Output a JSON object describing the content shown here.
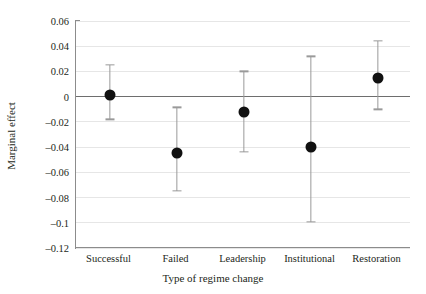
{
  "chart_data": {
    "type": "scatter",
    "title": "",
    "xlabel": "Type of regime change",
    "ylabel": "Marginal effect",
    "categories": [
      "Successful",
      "Failed",
      "Leadership",
      "Institutional",
      "Restoration"
    ],
    "values": [
      0.0015,
      -0.0445,
      -0.0125,
      -0.04,
      0.015
    ],
    "error_low": [
      -0.018,
      -0.0745,
      -0.044,
      -0.099,
      -0.01
    ],
    "error_high": [
      0.025,
      -0.0085,
      0.02,
      0.032,
      0.044
    ],
    "ylim": [
      -0.12,
      0.06
    ],
    "yticks": [
      0.06,
      0.04,
      0.02,
      0,
      -0.02,
      -0.04,
      -0.06,
      -0.08,
      -0.1,
      -0.12
    ],
    "ytick_labels": [
      "0.06",
      "0.04",
      "0.02",
      "0",
      "–0.02",
      "–0.04",
      "–0.06",
      "–0.08",
      "–0.1",
      "–0.12"
    ],
    "grid": true,
    "legend": "none",
    "reference_line": 0,
    "marker_color": "#111111",
    "errorbar_color": "#9a9a9a",
    "gridline_color": "#e6e6e6",
    "axis_color": "#8c8c8c"
  }
}
